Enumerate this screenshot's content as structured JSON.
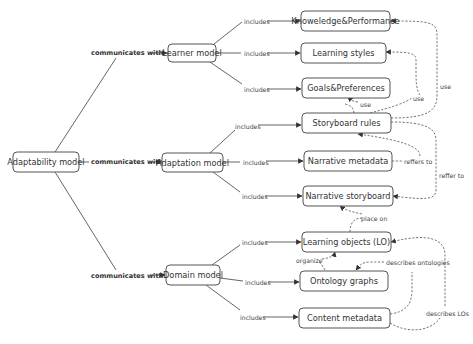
{
  "nodes": {
    "adaptability": "Adaptability model",
    "learner": "Learner model",
    "adaptation": "Adaptation model",
    "domain": "Domain model",
    "knowledge": "Knoweledge&Performance",
    "learning_styles": "Learning styles",
    "goals": "Goals&Preferences",
    "storyboard_rules": "Storyboard rules",
    "narrative_metadata": "Narrative metadata",
    "narrative_storyboard": "Narrative storyboard",
    "learning_objects": "Learning objects (LO)",
    "ontology_graphs": "Ontology graphs",
    "content_metadata": "Content metadata"
  },
  "edge_labels": {
    "communicates_with": "communicates with",
    "includes": "includes",
    "use": "use",
    "reffers_to": "reffers to",
    "reffer_to": "reffer to",
    "place_on": "place on",
    "organize": "organize",
    "describes_ontologies": "describes ontologies",
    "describes_los": "describes LOs"
  },
  "colors": {
    "stroke": "#555555",
    "text": "#333333",
    "background": "#ffffff"
  }
}
